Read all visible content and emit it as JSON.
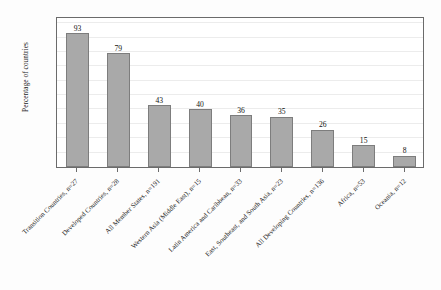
{
  "chart_data": {
    "type": "bar",
    "title": "",
    "subtitle": "",
    "xlabel": "",
    "ylabel": "Percentage of countries",
    "ylim": [
      0,
      105
    ],
    "yticks": [
      0,
      20,
      40,
      60,
      80,
      100
    ],
    "ytick_labels": [
      "0",
      "20",
      "40",
      "60",
      "80",
      "100"
    ],
    "grid": true,
    "gridlines_at": [
      10,
      20,
      30,
      40,
      50,
      60,
      70,
      80,
      90,
      100
    ],
    "legend": null,
    "legend_position": "none",
    "bar_color": "#a9a9a9",
    "bar_edge_color": "#7d7d7d",
    "frame_color": "#6b6b6b",
    "gridline_color": "#ececec",
    "background_color": "#fdfdfd",
    "plot_background_color": "#ffffff",
    "show_value_labels": true,
    "categories": [
      "Transition Countries, n=27",
      "Developed Countries, n=28",
      "All Member States, n=191",
      "Western Asia (Middle East), n=15",
      "Latin America and Caribbean, n=33",
      "East, Southeast, and South Asia, n=23",
      "All Developing Countries, n=136",
      "Africa, n=53",
      "Oceania, n=12"
    ],
    "values": [
      93,
      79,
      43,
      40,
      36,
      35,
      26,
      15,
      8
    ],
    "value_labels": [
      "93",
      "79",
      "43",
      "40",
      "36",
      "35",
      "26",
      "15",
      "8"
    ]
  }
}
